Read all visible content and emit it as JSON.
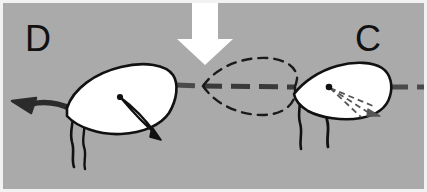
{
  "figure": {
    "background_color": "#aaaaaa",
    "border_color": "#f2f2f2",
    "width": 427,
    "height": 192
  },
  "labels": {
    "left_panel_label": "D",
    "right_panel_label": "C"
  },
  "colors": {
    "background": "#aaaaaa",
    "cell_fill": "#ffffff",
    "outline": "#111111",
    "dashed_outline": "#1a1a1a",
    "swim_path": "#4a4a4a",
    "motion_arrow": "#2b2b2b",
    "stimulus_arrow": "#ffffff"
  },
  "elements": {
    "stimulus_arrow": {
      "name": "white-down-arrow",
      "direction": "down",
      "fill": "#ffffff"
    },
    "swim_path": {
      "name": "dashed-trajectory-line",
      "style": "dashed",
      "orientation": "horizontal",
      "color": "#4a4a4a"
    },
    "ghost_cell": {
      "name": "dashed-phantom-cell-outline",
      "style": "dashed",
      "shape": "lens"
    },
    "left_cell": {
      "name": "cell-d",
      "fill": "#ffffff",
      "flagella_count": 2,
      "internal_marker": "white-blade-arrow",
      "heading": "left"
    },
    "right_cell": {
      "name": "cell-c",
      "fill": "#ffffff",
      "flagella_count": 2,
      "internal_marker": "dashed-fan-arrow",
      "heading": "right"
    },
    "direction_arrow": {
      "name": "curved-left-arrow",
      "direction": "left",
      "color": "#2b2b2b"
    }
  }
}
